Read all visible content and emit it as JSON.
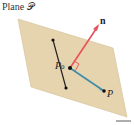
{
  "title": "Plane 𝒫",
  "labels": {
    "normal": "n",
    "point0": "P",
    "point0_sub": "0",
    "point": "P"
  },
  "colors": {
    "plane_fill": "#e6d4ae",
    "plane_edge": "#cdb88c",
    "normal_vector": "#e8505b",
    "vector_P0P": "#3d8ca8",
    "line": "#222222",
    "right_angle": "#e8505b"
  }
}
